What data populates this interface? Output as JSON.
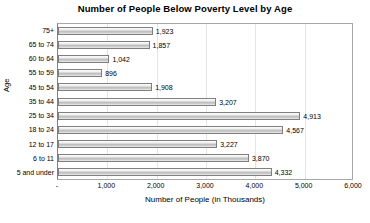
{
  "chart_data": {
    "type": "bar",
    "orientation": "horizontal",
    "title": "Number of People Below Poverty Level by Age",
    "xlabel": "Number of People (in Thousands)",
    "ylabel": "Age",
    "categories": [
      "75+",
      "65 to 74",
      "60 to 64",
      "55 to 59",
      "45 to 54",
      "35 to 44",
      "25 to 34",
      "18 to 24",
      "12 to 17",
      "6 to 11",
      "5 and under"
    ],
    "values": [
      1923,
      1857,
      1042,
      896,
      1908,
      3207,
      4913,
      4567,
      3227,
      3870,
      4332
    ],
    "value_labels": [
      "1,923",
      "1,857",
      "1,042",
      "896",
      "1,908",
      "3,207",
      "4,913",
      "4,567",
      "3,227",
      "3,870",
      "4,332"
    ],
    "xlim": [
      0,
      6000
    ],
    "xticks": [
      0,
      1000,
      2000,
      3000,
      4000,
      5000,
      6000
    ],
    "xtick_labels": [
      "-",
      "1,000",
      "2,000",
      "3,000",
      "4,000",
      "5,000",
      "6,000"
    ],
    "grid": true,
    "grid_axis": "x",
    "legend": false,
    "bar_color": "#c8c8c8",
    "bar_border_color": "#7f7f7f",
    "plot_border_color": "#a6a6a6",
    "background_color": "#ffffff",
    "text_color": "#000000"
  }
}
